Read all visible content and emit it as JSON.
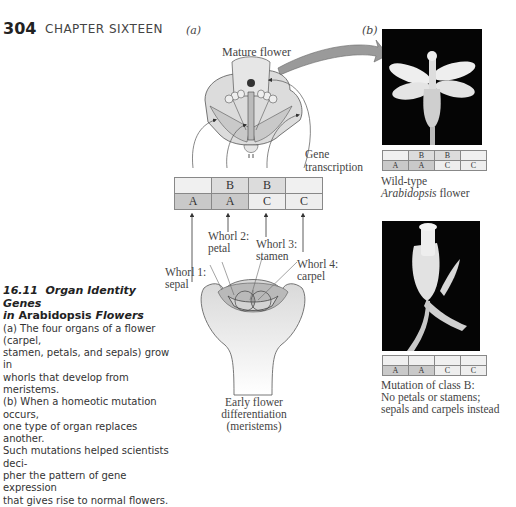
{
  "header": {
    "page_number": "304",
    "chapter": "CHAPTER SIXTEEN"
  },
  "panels": {
    "a_label": "(a)",
    "b_label": "(b)"
  },
  "diagram": {
    "mature_flower": "Mature flower",
    "gene_transcription_1": "Gene",
    "gene_transcription_2": "transcription",
    "abc_table": {
      "row1": [
        "",
        "B",
        "B",
        ""
      ],
      "row2": [
        "A",
        "A",
        "C",
        "C"
      ]
    },
    "whorls": [
      {
        "line1": "Whorl 1:",
        "line2": "sepal"
      },
      {
        "line1": "Whorl 2:",
        "line2": "petal"
      },
      {
        "line1": "Whorl 3:",
        "line2": "stamen"
      },
      {
        "line1": "Whorl 4:",
        "line2": "carpel"
      }
    ],
    "early_1": "Early flower",
    "early_2": "differentiation",
    "early_3": "(meristems)"
  },
  "wildtype": {
    "table": {
      "row1": [
        "",
        "B",
        "B",
        ""
      ],
      "row2": [
        "A",
        "A",
        "C",
        "C"
      ]
    },
    "label_1": "Wild-type",
    "label_2_italic": "Arabidopsis",
    "label_2_rest": " flower"
  },
  "mutant": {
    "table": {
      "row1": [
        "",
        "",
        "",
        ""
      ],
      "row2": [
        "A",
        "A",
        "C",
        "C"
      ]
    },
    "label_1": "Mutation of class B:",
    "label_2": "No petals or stamens;",
    "label_3": "sepals and carpels instead"
  },
  "caption": {
    "number": "16.11",
    "title_1": "Organ Identity Genes",
    "title_2_pre": "in ",
    "title_2_bold": "Arabidopsis",
    "title_2_post": " Flowers",
    "lines": [
      "(a) The four organs of a flower (carpel,",
      "stamen, petals, and sepals) grow in",
      "whorls that develop from meristems.",
      "(b) When a homeotic mutation occurs,",
      "one type of organ replaces another.",
      "Such mutations helped scientists deci-",
      "pher the pattern of gene expression",
      "that gives rise to normal flowers."
    ]
  },
  "colors": {
    "dark_cell": "#c9c9c9",
    "mid_cell": "#dcdcdc",
    "light_cell": "#f0f0f0",
    "arrow_gray": "#9a9a9a"
  }
}
